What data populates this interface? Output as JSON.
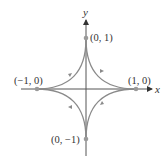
{
  "diagram": {
    "type": "parametric-curve",
    "curve": "astroid",
    "orientation": "counterclockwise",
    "axes": {
      "x_label": "x",
      "y_label": "y"
    },
    "points": [
      {
        "label": "(0, 1)",
        "x": 0,
        "y": 1
      },
      {
        "label": "(1, 0)",
        "x": 1,
        "y": 0
      },
      {
        "label": "(−1, 0)",
        "x": -1,
        "y": 0
      },
      {
        "label": "(0, −1)",
        "x": 0,
        "y": -1
      }
    ],
    "colors": {
      "curve": "#8a8a8a",
      "axis": "#555555",
      "point": "#999999",
      "text": "#333333"
    }
  }
}
